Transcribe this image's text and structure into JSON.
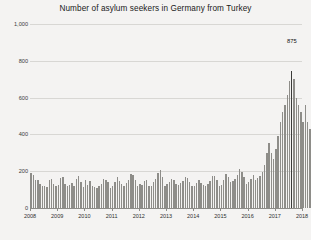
{
  "chart_data": {
    "type": "bar",
    "title": "Number of asylum seekers in Germany from Turkey",
    "xlabel": "",
    "ylabel": "",
    "ylim": [
      0,
      1000
    ],
    "yticks": [
      0,
      200,
      400,
      600,
      800,
      1000
    ],
    "ytick_labels": [
      "0",
      "200",
      "400",
      "600",
      "800",
      "1,000"
    ],
    "xticks": [
      2008,
      2009,
      2010,
      2011,
      2012,
      2013,
      2014,
      2015,
      2016,
      2017,
      2018
    ],
    "xtick_labels": [
      "2008",
      "2009",
      "2010",
      "2011",
      "2012",
      "2013",
      "2014",
      "2015",
      "2016",
      "2017",
      "2018"
    ],
    "grid": true,
    "legend": "none",
    "x_start": "2008-01",
    "x_frequency": "monthly",
    "annotations": [
      {
        "label": "875",
        "value": 875,
        "index": 115,
        "note": "final labelled peak bar"
      }
    ],
    "series": [
      {
        "name": "Asylum seekers from Turkey (monthly)",
        "color": "#8e8d89",
        "values": [
          190,
          178,
          150,
          152,
          128,
          120,
          118,
          112,
          150,
          158,
          130,
          118,
          124,
          162,
          168,
          130,
          120,
          126,
          138,
          120,
          160,
          172,
          142,
          112,
          150,
          126,
          148,
          120,
          114,
          110,
          118,
          128,
          160,
          152,
          142,
          110,
          118,
          140,
          170,
          146,
          132,
          120,
          136,
          150,
          186,
          178,
          150,
          120,
          130,
          126,
          148,
          150,
          118,
          122,
          142,
          160,
          192,
          206,
          168,
          122,
          128,
          140,
          160,
          150,
          130,
          126,
          138,
          146,
          170,
          164,
          140,
          118,
          122,
          136,
          150,
          138,
          126,
          120,
          130,
          148,
          172,
          176,
          150,
          120,
          126,
          150,
          186,
          170,
          140,
          146,
          160,
          178,
          210,
          196,
          166,
          128,
          140,
          156,
          178,
          150,
          162,
          176,
          198,
          236,
          300,
          352,
          300,
          268,
          320,
          392,
          470,
          520,
          560,
          612,
          690,
          742,
          700,
          600,
          560,
          520,
          470,
          560,
          470,
          430,
          520,
          610,
          875
        ]
      }
    ]
  }
}
